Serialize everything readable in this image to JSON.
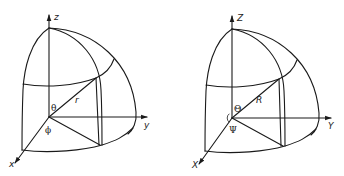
{
  "diagrams": [
    {
      "id": "left",
      "description": "Spherical coordinate octant, lowercase symbols",
      "labels": {
        "z_axis": "z",
        "y_axis": "y",
        "x_axis": "x",
        "polar_angle": "θ",
        "radius": "r",
        "azimuth": "ϕ"
      }
    },
    {
      "id": "right",
      "description": "Spherical coordinate octant, uppercase symbols",
      "labels": {
        "z_axis": "Z",
        "y_axis": "Y",
        "x_axis": "X",
        "polar_angle": "Θ",
        "radius": "R",
        "azimuth": "Ψ"
      }
    }
  ],
  "colors": {
    "stroke": "#1a1a1a",
    "background": "#ffffff"
  }
}
